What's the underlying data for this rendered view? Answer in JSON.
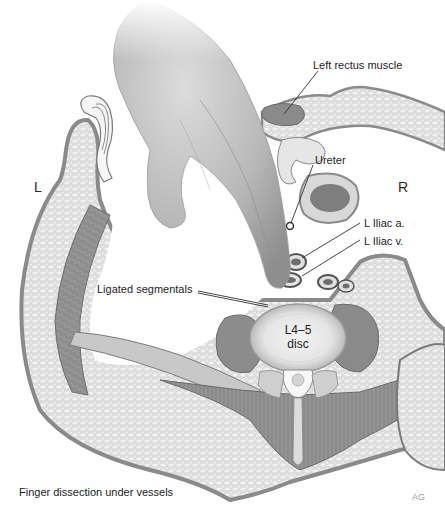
{
  "figure": {
    "type": "medical-illustration",
    "view": "axial cross-section, lumbar level",
    "orientation": {
      "left_label": "L",
      "right_label": "R"
    },
    "labels": [
      {
        "id": "left-rectus",
        "text": "Left rectus muscle"
      },
      {
        "id": "ureter",
        "text": "Ureter"
      },
      {
        "id": "iliac-artery",
        "text": "L Iliac a."
      },
      {
        "id": "iliac-vein",
        "text": "L Iliac v."
      },
      {
        "id": "ligated-segmentals",
        "text": "Ligated segmentals"
      }
    ],
    "disc_label_line1": "L4–5",
    "disc_label_line2": "disc",
    "caption": "Finger dissection under vessels",
    "signature": "AG",
    "colors": {
      "background": "#ffffff",
      "skin_outline": "#8a8a8a",
      "fat": "#d8d8d8",
      "muscle": "#8c8c8c",
      "disc_outer": "#c9c9c9",
      "disc_inner": "#ececec",
      "hand": "#b4b4b4",
      "label_text": "#1e1e1e"
    }
  }
}
